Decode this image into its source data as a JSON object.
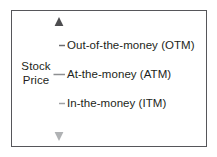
{
  "figure": {
    "type": "annotated-axis-diagram",
    "background_color": "#ffffff",
    "frame_color": "#56565a",
    "text_color": "#231f20",
    "axis_color_top": "#58585b",
    "axis_color_bottom": "#a7a9ac"
  },
  "axis": {
    "caption_line1": "Stock",
    "caption_line2": "Price",
    "direction": "vertical",
    "arrowheads": "both",
    "tick_count": 3
  },
  "labels": [
    {
      "id": "otm",
      "text": "Out-of-the-money (OTM)",
      "abbreviation": "OTM",
      "position": "top"
    },
    {
      "id": "atm",
      "text": "At-the-money (ATM)",
      "abbreviation": "ATM",
      "position": "middle"
    },
    {
      "id": "itm",
      "text": "In-the-money (ITM)",
      "abbreviation": "ITM",
      "position": "bottom"
    }
  ]
}
